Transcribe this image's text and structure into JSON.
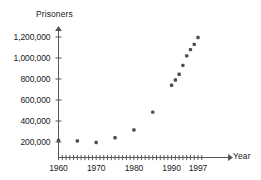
{
  "chart_data": {
    "type": "scatter",
    "title": "",
    "xlabel": "Year",
    "ylabel": "Prisoners",
    "xlim": [
      1959,
      1999
    ],
    "ylim": [
      150000,
      1230000
    ],
    "grid": false,
    "legend": null,
    "y_ticks": [
      200000,
      400000,
      600000,
      800000,
      1000000,
      1200000
    ],
    "y_tick_labels": [
      "200,000",
      "400,000",
      "600,000",
      "800,000",
      "1,000,000",
      "1,200,000"
    ],
    "x_ticks": [
      1960,
      1961,
      1962,
      1963,
      1964,
      1965,
      1966,
      1967,
      1968,
      1969,
      1970,
      1971,
      1972,
      1973,
      1974,
      1975,
      1976,
      1977,
      1978,
      1979,
      1980,
      1981,
      1982,
      1983,
      1984,
      1985,
      1986,
      1987,
      1988,
      1989,
      1990,
      1991,
      1992,
      1993,
      1994,
      1995,
      1996,
      1997,
      1998
    ],
    "x_tick_labels": [
      {
        "value": 1960,
        "label": "1960"
      },
      {
        "value": 1970,
        "label": "1970"
      },
      {
        "value": 1980,
        "label": "1980"
      },
      {
        "value": 1990,
        "label": "1990"
      },
      {
        "value": 1997,
        "label": "1997"
      }
    ],
    "marker_color": "#4d4d4d",
    "axis_color": "#555555",
    "x": [
      1960,
      1965,
      1970,
      1975,
      1980,
      1985,
      1990,
      1991,
      1992,
      1993,
      1994,
      1995,
      1996,
      1997,
      1998
    ],
    "values": [
      215000,
      210000,
      195000,
      240000,
      315000,
      485000,
      740000,
      790000,
      845000,
      930000,
      1020000,
      1080000,
      1130000,
      1195000,
      1195000
    ],
    "points": [
      {
        "x": 1960,
        "y": 215000
      },
      {
        "x": 1965,
        "y": 210000
      },
      {
        "x": 1970,
        "y": 195000
      },
      {
        "x": 1975,
        "y": 240000
      },
      {
        "x": 1980,
        "y": 315000
      },
      {
        "x": 1985,
        "y": 485000
      },
      {
        "x": 1990,
        "y": 740000
      },
      {
        "x": 1991,
        "y": 790000
      },
      {
        "x": 1992,
        "y": 845000
      },
      {
        "x": 1993,
        "y": 930000
      },
      {
        "x": 1994,
        "y": 1020000
      },
      {
        "x": 1995,
        "y": 1080000
      },
      {
        "x": 1996,
        "y": 1130000
      },
      {
        "x": 1997,
        "y": 1195000
      }
    ]
  }
}
